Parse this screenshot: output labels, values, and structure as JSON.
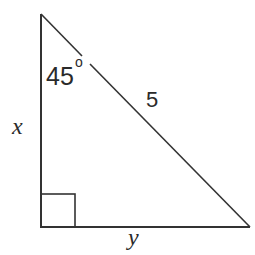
{
  "diagram": {
    "type": "right-triangle",
    "stroke_color": "#333333",
    "background": "#ffffff",
    "vertices": {
      "top": [
        41,
        14
      ],
      "right_angle": [
        41,
        227
      ],
      "bottom_right": [
        250,
        227
      ]
    },
    "labels": {
      "angle": "45",
      "degree_symbol": "o",
      "hypotenuse": "5",
      "vertical_leg": "x",
      "horizontal_leg": "y"
    },
    "right_angle_marker": true
  }
}
